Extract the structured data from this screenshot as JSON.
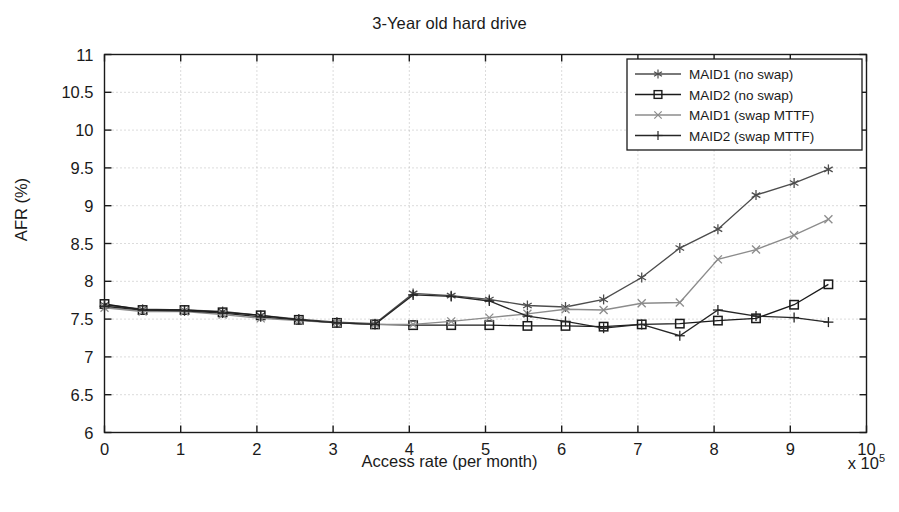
{
  "chart_data": {
    "type": "line",
    "title": "3-Year old hard drive",
    "xlabel": "Access rate (per month)",
    "ylabel": "AFR (%)",
    "x_exponent_label": "x 10",
    "x_exponent_power": "5",
    "xlim": [
      0,
      10
    ],
    "ylim": [
      6,
      11
    ],
    "xticks": [
      0,
      1,
      2,
      3,
      4,
      5,
      6,
      7,
      8,
      9,
      10
    ],
    "xtick_labels": [
      "0",
      "1",
      "2",
      "3",
      "4",
      "5",
      "6",
      "7",
      "8",
      "9",
      "10"
    ],
    "yticks": [
      6,
      6.5,
      7,
      7.5,
      8,
      8.5,
      9,
      9.5,
      10,
      10.5,
      11
    ],
    "ytick_labels": [
      "6",
      "6.5",
      "7",
      "7.5",
      "8",
      "8.5",
      "9",
      "9.5",
      "10",
      "10.5",
      "11"
    ],
    "grid": true,
    "grid_style": "dotted",
    "legend_position": "top-right",
    "x": [
      0.0,
      0.5,
      1.05,
      1.55,
      2.05,
      2.55,
      3.05,
      3.55,
      4.05,
      4.55,
      5.05,
      5.55,
      6.05,
      6.55,
      7.05,
      7.55,
      8.05,
      8.55,
      9.05,
      9.5
    ],
    "series": [
      {
        "name": "MAID1 (no swap)",
        "marker": "asterisk",
        "color": "#4d4d4d",
        "values": [
          7.69,
          7.63,
          7.62,
          7.6,
          7.55,
          7.5,
          7.46,
          7.44,
          7.84,
          7.81,
          7.76,
          7.68,
          7.66,
          7.76,
          8.05,
          8.44,
          8.69,
          9.14,
          9.3,
          9.48
        ]
      },
      {
        "name": "MAID2 (no swap)",
        "marker": "square",
        "color": "#1a1a1a",
        "values": [
          7.7,
          7.62,
          7.62,
          7.59,
          7.55,
          7.49,
          7.45,
          7.43,
          7.42,
          7.42,
          7.42,
          7.41,
          7.41,
          7.4,
          7.43,
          7.44,
          7.48,
          7.51,
          7.69,
          7.96
        ]
      },
      {
        "name": "MAID1 (swap MTTF)",
        "marker": "x",
        "color": "#8c8c8c",
        "values": [
          7.65,
          7.6,
          7.6,
          7.56,
          7.51,
          7.48,
          7.45,
          7.43,
          7.43,
          7.47,
          7.52,
          7.57,
          7.63,
          7.62,
          7.71,
          7.72,
          8.29,
          8.42,
          8.61,
          8.82
        ]
      },
      {
        "name": "MAID2 (swap MTTF)",
        "marker": "plus",
        "color": "#262626",
        "values": [
          7.67,
          7.62,
          7.61,
          7.58,
          7.53,
          7.49,
          7.45,
          7.43,
          7.82,
          7.8,
          7.74,
          7.54,
          7.47,
          7.38,
          7.43,
          7.28,
          7.62,
          7.54,
          7.52,
          7.46
        ]
      }
    ]
  }
}
